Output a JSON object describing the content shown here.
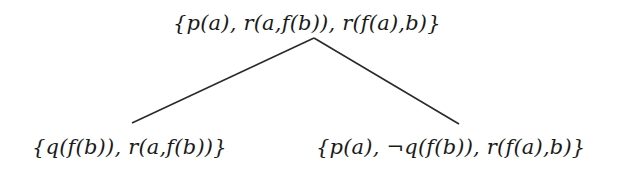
{
  "diagram": {
    "type": "tree",
    "root": {
      "label": "{p(a), r(a,f(b)), r(f(a),b)}"
    },
    "children": [
      {
        "label": "{q(f(b)), r(a,f(b))}"
      },
      {
        "label": "{p(a), ¬q(f(b)), r(f(a),b)}"
      }
    ],
    "edges": [
      {
        "from": "root",
        "to": "child-0"
      },
      {
        "from": "root",
        "to": "child-1"
      }
    ]
  }
}
